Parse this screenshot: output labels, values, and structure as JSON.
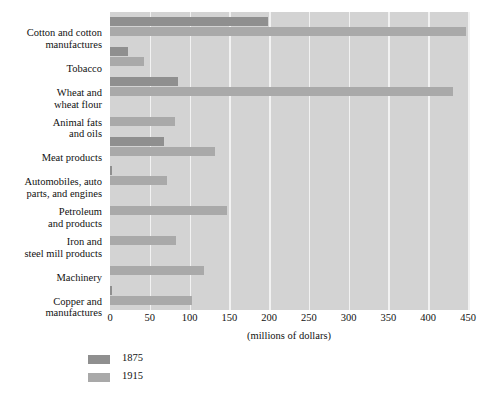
{
  "chart_data": {
    "type": "bar",
    "orientation": "horizontal",
    "title": "",
    "subtitle": "",
    "xlabel": "(millions of dollars)",
    "ylabel": "",
    "xlim": [
      0,
      450
    ],
    "xticks": [
      0,
      50,
      100,
      150,
      200,
      250,
      300,
      350,
      400,
      450
    ],
    "xtick_labels": [
      "0",
      "50",
      "100",
      "150",
      "200",
      "250",
      "300",
      "350",
      "400",
      "450"
    ],
    "grid": true,
    "grid_axis": "x",
    "legend_position": "below-left",
    "plot_background": "#d3d3d3",
    "categories": [
      "Cotton and cotton manufactures",
      "Tobacco",
      "Wheat and wheat flour",
      "Animal fats and oils",
      "Meat products",
      "Automobiles, auto parts, and engines",
      "Petroleum and products",
      "Iron and steel mill products",
      "Machinery",
      "Copper and manufactures"
    ],
    "category_lines": [
      [
        "Cotton and cotton",
        "manufactures"
      ],
      [
        "Tobacco"
      ],
      [
        "Wheat and",
        "wheat flour"
      ],
      [
        "Animal fats",
        "and oils"
      ],
      [
        "Meat products"
      ],
      [
        "Automobiles, auto",
        "parts, and engines"
      ],
      [
        "Petroleum",
        "and products"
      ],
      [
        "Iron and",
        "steel mill products"
      ],
      [
        "Machinery"
      ],
      [
        "Copper and",
        "manufactures"
      ]
    ],
    "series": [
      {
        "name": "1875",
        "color": "#8f8f8f",
        "values": [
          198,
          23,
          86,
          0,
          68,
          2,
          0,
          0,
          0,
          2
        ]
      },
      {
        "name": "1915",
        "color": "#a9a9a9",
        "values": [
          447,
          43,
          431,
          82,
          132,
          72,
          147,
          83,
          118,
          103
        ]
      }
    ]
  },
  "legend": {
    "entries": [
      {
        "label": "1875",
        "color": "#8f8f8f"
      },
      {
        "label": "1915",
        "color": "#a9a9a9"
      }
    ]
  },
  "axis": {
    "x_title": "(millions of dollars)"
  }
}
